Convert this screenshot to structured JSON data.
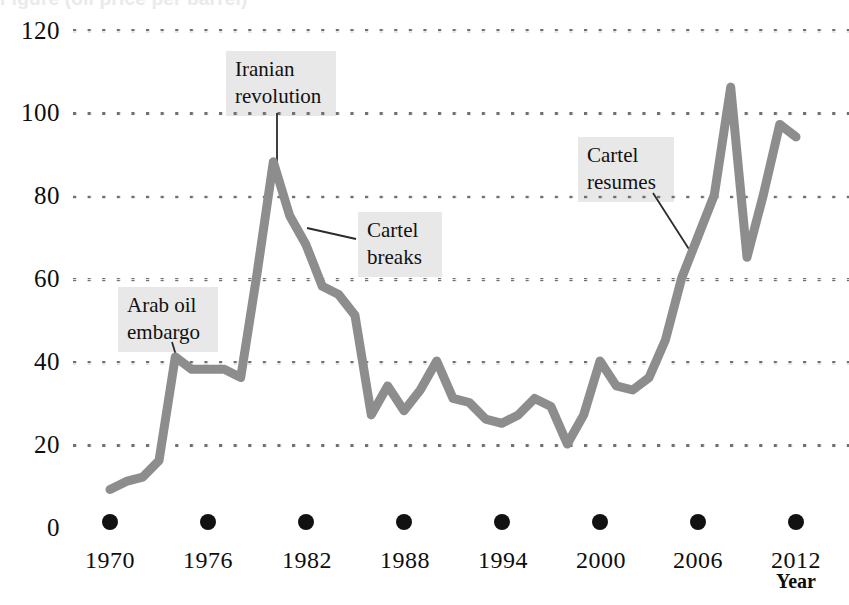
{
  "title_partial": "Figure (oil price per barrel)",
  "axis": {
    "x_name": "Year",
    "y_ticks": [
      "120",
      "100",
      "80",
      "60",
      "40",
      "20",
      "0"
    ],
    "x_ticks": [
      "1970",
      "1976",
      "1982",
      "1988",
      "1994",
      "2000",
      "2006",
      "2012"
    ]
  },
  "annotations": [
    {
      "name": "arab-oil-embargo",
      "text": "Arab oil\nembargo"
    },
    {
      "name": "iranian-revolution",
      "text": "Iranian\nrevolution"
    },
    {
      "name": "cartel-breaks",
      "text": "Cartel\nbreaks"
    },
    {
      "name": "cartel-resumes",
      "text": "Cartel\nresumes"
    }
  ],
  "colors": {
    "line": "#8d8d8d",
    "gridline": "#6f6f6f",
    "annotation_bg": "#e8e8e8",
    "text": "#111111"
  },
  "chart_data": {
    "type": "line",
    "title": "",
    "xlabel": "Year",
    "ylabel": "",
    "xlim": [
      1970,
      2012
    ],
    "ylim": [
      0,
      120
    ],
    "grid": true,
    "legend": "none",
    "x": [
      1970,
      1971,
      1972,
      1973,
      1974,
      1975,
      1976,
      1977,
      1978,
      1979,
      1980,
      1981,
      1982,
      1983,
      1984,
      1985,
      1986,
      1987,
      1988,
      1989,
      1990,
      1991,
      1992,
      1993,
      1994,
      1995,
      1996,
      1997,
      1998,
      1999,
      2000,
      2001,
      2002,
      2003,
      2004,
      2005,
      2006,
      2007,
      2008,
      2009,
      2010,
      2011,
      2012
    ],
    "values": [
      9,
      11,
      12,
      16,
      41,
      38,
      38,
      38,
      36,
      61,
      88,
      75,
      68,
      58,
      56,
      51,
      27,
      34,
      28,
      33,
      40,
      31,
      30,
      26,
      25,
      27,
      31,
      29,
      20,
      27,
      40,
      34,
      33,
      36,
      45,
      60,
      70,
      80,
      106,
      65,
      80,
      97,
      94
    ],
    "annotations": [
      {
        "label": "Arab oil embargo",
        "x": 1974,
        "y": 41
      },
      {
        "label": "Iranian revolution",
        "x": 1980,
        "y": 88
      },
      {
        "label": "Cartel breaks",
        "x": 1981,
        "y": 75
      },
      {
        "label": "Cartel resumes",
        "x": 2005,
        "y": 60
      }
    ]
  }
}
